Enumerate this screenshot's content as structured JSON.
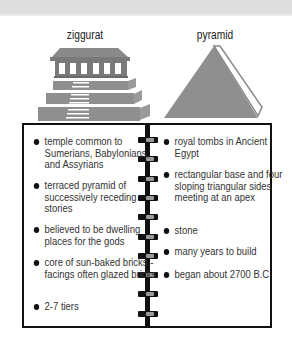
{
  "header": {
    "band": "top-band"
  },
  "illustrations": {
    "ziggurat": {
      "label": "ziggurat"
    },
    "pyramid": {
      "label": "pyramid"
    }
  },
  "colors": {
    "structure_gray": "#8f8f8f",
    "structure_dark": "#6f6f6f",
    "notebook_border": "#111111",
    "ring_gray": "#9a9a9a",
    "band_gray": "#dedede"
  },
  "notebook": {
    "left_column": {
      "subject": "ziggurat",
      "items": [
        "temple common to Sumerians, Babylonians, and Assyrians",
        "terraced pyramid of successively receding stories",
        "believed to be dwelling places for the gods",
        "core of sun-baked bricks - facings often glazed bricks",
        "2-7 tiers"
      ]
    },
    "right_column": {
      "subject": "pyramid",
      "items": [
        "royal tombs in Ancient Egypt",
        "rectangular base and four sloping triangular sides meeting at an apex",
        "stone",
        "many years to build",
        "began about 2700 B.C."
      ]
    },
    "ring_count": 10
  }
}
